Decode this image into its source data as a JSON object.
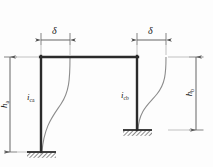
{
  "figure": {
    "type": "structural-frame-deflection-diagram",
    "stroke_color": "#2b2b2b",
    "curve_color": "#8c8c8c",
    "dimension_color": "#4a4a4a",
    "background": "#fdfdfd"
  },
  "labels": {
    "delta_left": "δ",
    "delta_right": "δ",
    "column_left_stiffness": "i",
    "column_left_stiffness_sub": "ca",
    "column_right_stiffness": "i",
    "column_right_stiffness_sub": "cb",
    "height_left": "h",
    "height_left_sub": "a",
    "height_right": "h",
    "height_right_sub": "b"
  },
  "geometry": {
    "beam_y": 57,
    "column_left_x": 41,
    "column_right_x": 137,
    "base_left_y": 152,
    "base_right_y": 130,
    "dim_left_x": 10,
    "dim_right_x": 196,
    "delta_line_y": 40,
    "delta_left_start_x": 41,
    "delta_left_end_x": 70,
    "delta_right_start_x": 137,
    "delta_right_end_x": 166
  }
}
